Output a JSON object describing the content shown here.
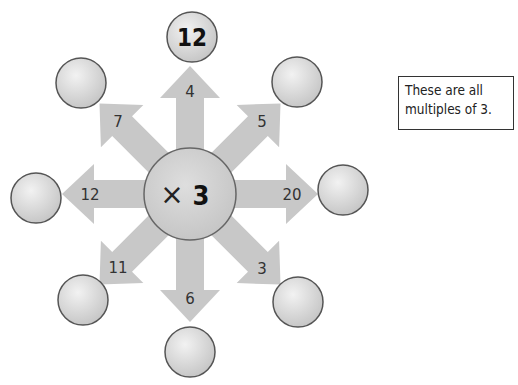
{
  "diagram": {
    "center": {
      "operator": "×",
      "multiplier": "3"
    },
    "spokes": [
      {
        "direction": "up",
        "input": "4",
        "answer": "12"
      },
      {
        "direction": "up-right",
        "input": "5",
        "answer": ""
      },
      {
        "direction": "right",
        "input": "20",
        "answer": ""
      },
      {
        "direction": "down-right",
        "input": "3",
        "answer": ""
      },
      {
        "direction": "down",
        "input": "6",
        "answer": ""
      },
      {
        "direction": "down-left",
        "input": "11",
        "answer": ""
      },
      {
        "direction": "left",
        "input": "12",
        "answer": ""
      },
      {
        "direction": "up-left",
        "input": "7",
        "answer": ""
      }
    ],
    "note": {
      "line1": "These are all",
      "line2": "multiples of 3."
    }
  },
  "colors": {
    "arrow": "#c9c9c9",
    "circle_fill": "#dcdcdc",
    "circle_border": "#555555",
    "text": "#222222"
  }
}
